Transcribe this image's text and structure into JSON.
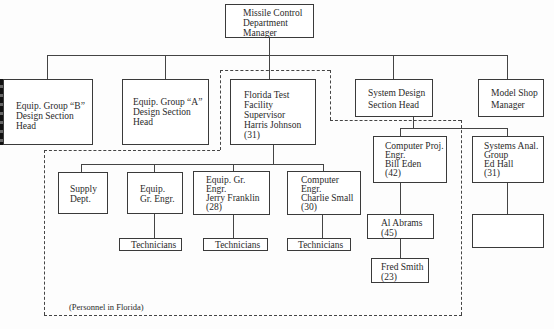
{
  "diagram": {
    "type": "org-chart",
    "region_label": "(Personnel in Florida)",
    "nodes": {
      "top": {
        "label": "Missile Control\nDepartment\nManager"
      },
      "group_b": {
        "label": "Equip. Group “B”\nDesign Section\nHead"
      },
      "group_a": {
        "label": "Equip. Group “A”\nDesign Section\nHead"
      },
      "florida": {
        "label": "Florida Test\nFacility\nSupervisor\nHarris Johnson\n(31)"
      },
      "system_design": {
        "label": "System Design\nSection Head"
      },
      "model_shop": {
        "label": "Model Shop\nManager"
      },
      "supply": {
        "label": "Supply\nDept."
      },
      "equip_gr_engr": {
        "label": "Equip.\nGr. Engr."
      },
      "jerry": {
        "label": "Equip. Gr.\nEngr.\nJerry Franklin\n(28)"
      },
      "charlie": {
        "label": "Computer\nEngr.\nCharlie Small\n(30)"
      },
      "tech1": {
        "label": "Technicians"
      },
      "tech2": {
        "label": "Technicians"
      },
      "tech3": {
        "label": "Technicians"
      },
      "bill": {
        "label": "Computer Proj.\nEngr.\nBill Eden\n(42)"
      },
      "ed": {
        "label": "Systems Anal.\nGroup\nEd Hall\n(31)"
      },
      "al": {
        "label": "Al Abrams\n(45)"
      },
      "fred": {
        "label": "Fred Smith\n(23)"
      },
      "empty": {
        "label": ""
      }
    },
    "edges": [
      [
        "top",
        "group_b"
      ],
      [
        "top",
        "group_a"
      ],
      [
        "top",
        "florida"
      ],
      [
        "top",
        "system_design"
      ],
      [
        "top",
        "model_shop"
      ],
      [
        "florida",
        "supply"
      ],
      [
        "florida",
        "equip_gr_engr"
      ],
      [
        "florida",
        "jerry"
      ],
      [
        "florida",
        "charlie"
      ],
      [
        "equip_gr_engr",
        "tech1"
      ],
      [
        "jerry",
        "tech2"
      ],
      [
        "charlie",
        "tech3"
      ],
      [
        "system_design",
        "bill"
      ],
      [
        "system_design",
        "ed"
      ],
      [
        "bill",
        "al"
      ],
      [
        "al",
        "fred"
      ],
      [
        "ed",
        "empty"
      ]
    ]
  }
}
